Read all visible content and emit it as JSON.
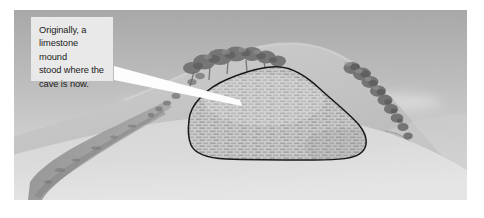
{
  "figure": {
    "name": "limestone-mound-cave-formation",
    "caption_text": "Originally, a\nlimestone mound\nstood where the\ncave is now.",
    "callout": {
      "line_1": "Originally, a",
      "line_2": "limestone mound",
      "line_3": "stood where the",
      "line_4": "cave is now.",
      "background_color": "#e9e9e9",
      "text_color": "#1b1b1b"
    },
    "scene": {
      "sky_top_color": "#b0b0b0",
      "sky_bottom_color": "#dedede",
      "hill_color": "#c5c5c5",
      "hill_shadow_color": "#b4b4b4",
      "foreground_color": "#d8d8d8",
      "gully_color": "#8d8d8d",
      "tree_color": "#6f6f6f",
      "mound_fill_color": "#bdbdbd",
      "mound_outline_color": "#141414",
      "leader_color": "#fdfdfd",
      "plate_border_color": "#ffffff"
    },
    "labels": {
      "mound_region": "limestone mound",
      "hill_region": "hillside",
      "gully_region": "gully",
      "sky_region": "sky",
      "tree_group_left": "ridge trees",
      "tree_group_right": "slope trees"
    }
  }
}
